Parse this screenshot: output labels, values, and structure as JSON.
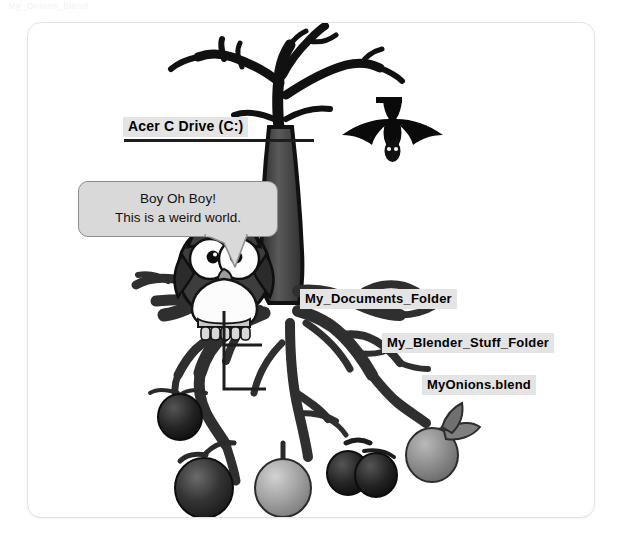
{
  "page": {
    "ghost_header_text": "My_Onions_blend",
    "background_color": "#ffffff",
    "card_border_color": "#e2e2e2",
    "ink_color": "#1d1d1d",
    "chip_background": "#e4e4e4"
  },
  "labels": {
    "drive": "Acer C Drive (C:)",
    "documents_folder": "My_Documents_Folder",
    "blender_stuff_folder": "My_Blender_Stuff_Folder",
    "blend_file": "MyOnions.blend"
  },
  "speech_bubble": {
    "line1": "Boy Oh Boy!",
    "line2": "This is a weird world.",
    "fill_color": "#d9d9d9",
    "border_color": "#8d8d8d"
  },
  "illustration": {
    "title": "bare-tree-with-roots",
    "tree_color": "#4a4a4a",
    "outline_color": "#111111",
    "characters": [
      {
        "name": "owl",
        "body_color": "#3f3f3f",
        "eye_color": "#ffffff",
        "pupil_color": "#111111",
        "beak_color": "#9a9a9a",
        "chest_color": "#fbfbfb"
      },
      {
        "name": "bat",
        "body_color": "#0a0a0a"
      }
    ],
    "fruits": [
      {
        "name": "onion-dark-upper-left",
        "color": "#2f2f2f"
      },
      {
        "name": "onion-dark-large-left",
        "color": "#3a3a3a"
      },
      {
        "name": "onion-light-center-left",
        "color": "#9c9c9c"
      },
      {
        "name": "onion-dark-pair-a",
        "color": "#2a2a2a"
      },
      {
        "name": "onion-dark-pair-b",
        "color": "#2a2a2a"
      },
      {
        "name": "onion-gray-right",
        "color": "#8d8d8d"
      }
    ]
  }
}
